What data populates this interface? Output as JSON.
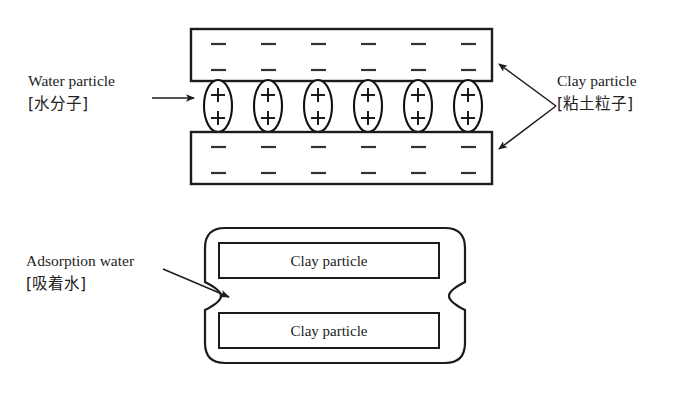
{
  "figure": {
    "background_color": "#ffffff",
    "line_color": "#1c1c1c"
  },
  "labels": {
    "water_particle": {
      "en": "Water particle",
      "jp": "[水分子]"
    },
    "clay_particle": {
      "en": "Clay particle",
      "jp": "[粘土粒子]"
    },
    "adsorption_water": {
      "en": "Adsorption water",
      "jp": "[吸着水]"
    }
  },
  "top_diagram": {
    "charge_negative": "−",
    "charge_positive": "+",
    "negative_rows": 2,
    "charge_columns": 6,
    "water_ellipse_count": 6,
    "ellipse_centers_x": [
      218,
      268,
      318,
      368,
      418,
      468
    ],
    "clay_slabs": [
      {
        "name": "upper-clay-slab",
        "x": 191,
        "y": 29,
        "width": 301,
        "height": 52
      },
      {
        "name": "lower-clay-slab",
        "x": 191,
        "y": 132,
        "width": 301,
        "height": 52
      }
    ],
    "negative_rows_y": [
      44,
      70,
      147,
      173
    ],
    "plus_rows_y": [
      95,
      118
    ]
  },
  "bottom_diagram": {
    "outer_shape": "rounded-blob-with-side-pinch",
    "outer_bounds": {
      "x": 205,
      "y": 228,
      "width": 260,
      "height": 135
    },
    "inner_boxes": [
      {
        "name": "clay-particle-box-top",
        "label": "Clay particle",
        "x": 219,
        "y": 243,
        "width": 220,
        "height": 35
      },
      {
        "name": "clay-particle-box-bottom",
        "label": "Clay particle",
        "x": 219,
        "y": 313,
        "width": 220,
        "height": 35
      }
    ]
  },
  "annotations": {
    "water_arrow": {
      "name": "water-particle-arrow",
      "from_x": 152,
      "from_y": 98,
      "to_x": 196,
      "to_y": 98
    },
    "clay_arrow": {
      "name": "clay-particle-double-arrow",
      "apex_x": 556,
      "apex_y": 106,
      "tip_top_x": 496,
      "tip_top_y": 62,
      "tip_bottom_x": 496,
      "tip_bottom_y": 151
    },
    "adsorption_arrow": {
      "name": "adsorption-water-arrow",
      "from_x": 163,
      "from_y": 269,
      "to_x": 232,
      "to_y": 298
    }
  }
}
